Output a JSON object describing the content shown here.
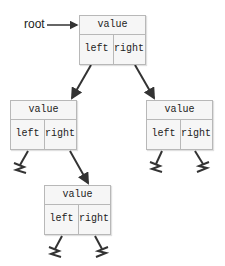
{
  "root_pointer": {
    "label": "root"
  },
  "nodes": {
    "root": {
      "value": "value",
      "left": "left",
      "right": "right"
    },
    "left": {
      "value": "value",
      "left": "left",
      "right": "right"
    },
    "right": {
      "value": "value",
      "left": "left",
      "right": "right"
    },
    "left_right": {
      "value": "value",
      "left": "left",
      "right": "right"
    }
  },
  "null_symbol": "ground-null-icon",
  "colors": {
    "box_border": "#b8b8b8",
    "box_fill": "#f6f6f6",
    "edge": "#333333"
  }
}
